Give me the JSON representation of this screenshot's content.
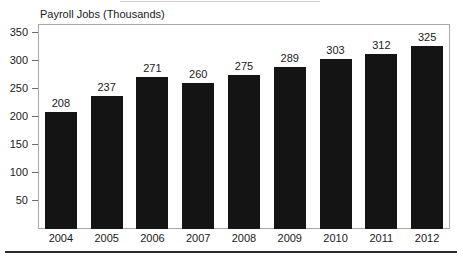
{
  "chart_data": {
    "type": "bar",
    "title": "Payroll Jobs (Thousands)",
    "xlabel": "",
    "ylabel": "",
    "categories": [
      "2004",
      "2005",
      "2006",
      "2007",
      "2008",
      "2009",
      "2010",
      "2011",
      "2012"
    ],
    "values": [
      208,
      237,
      271,
      260,
      275,
      289,
      303,
      312,
      325
    ],
    "value_labels": [
      "208",
      "237",
      "271",
      "260",
      "275",
      "289",
      "303",
      "312",
      "325"
    ],
    "ylim": [
      0,
      365
    ],
    "yticks": [
      50,
      100,
      150,
      200,
      250,
      300,
      350
    ],
    "ytick_labels": [
      "50",
      "100",
      "150",
      "200",
      "250",
      "300",
      "350"
    ],
    "grid": false,
    "legend": false,
    "bar_color": "#141414",
    "frame_color": "#a8a8a8",
    "text_color": "#1a1a1a",
    "background": "#ffffff"
  }
}
